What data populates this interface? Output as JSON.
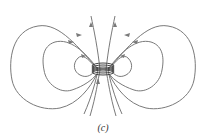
{
  "figure": {
    "caption": "(c)",
    "colors": {
      "field_line": "#7a7a7a",
      "coil": "#444444",
      "background": "#ffffff"
    }
  }
}
